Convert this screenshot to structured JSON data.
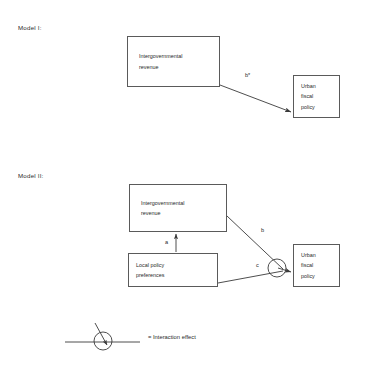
{
  "figure": {
    "models": [
      {
        "id": "model-1",
        "label": "Model I:",
        "nodes": [
          {
            "id": "igr-1",
            "text": "Intergovernmental\nrevenue"
          },
          {
            "id": "ufp-1",
            "text": "Urban\nfiscal\npolicy"
          }
        ],
        "edges": [
          {
            "id": "edge-b-star",
            "label": "b*",
            "from": "igr-1",
            "to": "ufp-1"
          }
        ]
      },
      {
        "id": "model-2",
        "label": "Model II:",
        "nodes": [
          {
            "id": "igr-2",
            "text": "Intergovernmental\nrevenue"
          },
          {
            "id": "lpp-2",
            "text": "Local policy\npreferences"
          },
          {
            "id": "ufp-2",
            "text": "Urban\nfiscal\npolicy"
          }
        ],
        "edges": [
          {
            "id": "edge-a",
            "label": "a",
            "from": "lpp-2",
            "to": "igr-2"
          },
          {
            "id": "edge-b",
            "label": "b",
            "from": "igr-2",
            "to": "ufp-2"
          },
          {
            "id": "edge-c",
            "label": "c",
            "from": "lpp-2",
            "to": "ufp-2"
          }
        ]
      }
    ],
    "legend": {
      "symbol_name": "interaction-effect-symbol",
      "text": "= Interaction effect"
    }
  }
}
